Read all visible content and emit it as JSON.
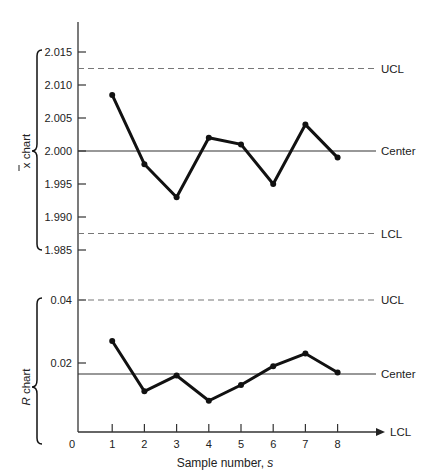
{
  "chart_data": [
    {
      "type": "line",
      "title": "x-bar chart",
      "ylabel": "x̄ chart",
      "xlabel": "Sample number, s",
      "x": [
        1,
        2,
        3,
        4,
        5,
        6,
        7,
        8
      ],
      "series": [
        {
          "name": "x̄",
          "values": [
            2.0085,
            1.998,
            1.993,
            2.002,
            2.001,
            1.995,
            2.004,
            1.999
          ]
        }
      ],
      "yticks": [
        2.015,
        2.01,
        2.005,
        2.0,
        1.995,
        1.99,
        1.985
      ],
      "ytick_labels": [
        "2.015",
        "2.010",
        "2.005",
        "2.000",
        "1.995",
        "1.990",
        "1.985"
      ],
      "ylim": [
        1.985,
        2.015
      ],
      "reference_lines": [
        {
          "name": "UCL",
          "value": 2.0125,
          "style": "dashed"
        },
        {
          "name": "Center",
          "value": 2.0,
          "style": "solid"
        },
        {
          "name": "LCL",
          "value": 1.9875,
          "style": "dashed"
        }
      ],
      "grid": false
    },
    {
      "type": "line",
      "title": "R chart",
      "ylabel": "R chart",
      "xlabel": "Sample number, s",
      "x": [
        1,
        2,
        3,
        4,
        5,
        6,
        7,
        8
      ],
      "series": [
        {
          "name": "R",
          "values": [
            0.027,
            0.011,
            0.016,
            0.008,
            0.013,
            0.019,
            0.023,
            0.017
          ]
        }
      ],
      "yticks": [
        0.04,
        0.02,
        0
      ],
      "ytick_labels": [
        "0.04",
        "0.02",
        "0"
      ],
      "xticks": [
        1,
        2,
        3,
        4,
        5,
        6,
        7,
        8
      ],
      "xtick_labels": [
        "1",
        "2",
        "3",
        "4",
        "5",
        "6",
        "7",
        "8"
      ],
      "ylim": [
        0,
        0.045
      ],
      "reference_lines": [
        {
          "name": "UCL",
          "value": 0.04,
          "style": "dashed"
        },
        {
          "name": "Center",
          "value": 0.0165,
          "style": "solid"
        },
        {
          "name": "LCL",
          "value": 0,
          "style": "axis-arrow"
        }
      ],
      "grid": false
    }
  ],
  "labels": {
    "xbar_chart": "x chart",
    "r_chart_italic": "R",
    "r_chart_rest": " chart",
    "xlabel_main": "Sample number, ",
    "xlabel_var": "s",
    "origin": "0",
    "ucl": "UCL",
    "center": "Center",
    "lcl": "LCL"
  },
  "colors": {
    "ink": "#111111",
    "axis": "#333333",
    "dashed": "#777777",
    "text": "#222222"
  }
}
